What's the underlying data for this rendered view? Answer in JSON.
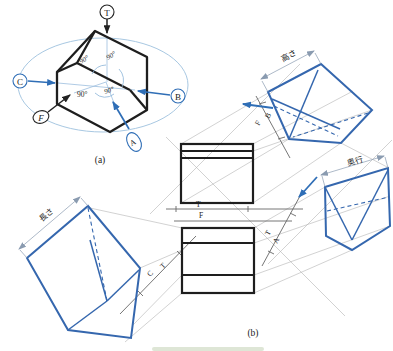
{
  "figure": {
    "caption_a": "(a)",
    "caption_b": "(b)",
    "pictorial": {
      "label_t": "T",
      "label_c": "C",
      "label_b": "B",
      "label_f": "F",
      "label_a": "A",
      "angle1": "90°",
      "angle2": "90°",
      "angle3": "90°",
      "angle4": "90°"
    },
    "projection": {
      "fold_tf": {
        "top": "T",
        "bottom": "F"
      },
      "fold_tc": {
        "first": "T",
        "second": "C"
      },
      "fold_ta": {
        "first": "T",
        "second": "A"
      },
      "fold_fb": {
        "first": "F",
        "second": "B"
      },
      "dim_height": "高さ",
      "dim_depth": "奥行",
      "dim_length": "長さ"
    },
    "colors": {
      "line_black": "#1e1e1e",
      "view_blue": "#3567ae",
      "accent_blue": "#2f6eb6",
      "dim_pink": "#d98880",
      "light_blue": "#a8c8e2",
      "fold_gray": "#666666",
      "transfer_gray": "#b3b3b3"
    }
  }
}
